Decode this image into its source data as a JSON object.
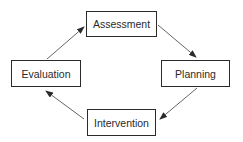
{
  "diagram": {
    "type": "cycle",
    "nodes": [
      {
        "id": "assessment",
        "label": "Assessment"
      },
      {
        "id": "planning",
        "label": "Planning"
      },
      {
        "id": "intervention",
        "label": "Intervention"
      },
      {
        "id": "evaluation",
        "label": "Evaluation"
      }
    ],
    "edges": [
      {
        "from": "assessment",
        "to": "planning"
      },
      {
        "from": "planning",
        "to": "intervention"
      },
      {
        "from": "intervention",
        "to": "evaluation"
      },
      {
        "from": "evaluation",
        "to": "assessment"
      }
    ],
    "colors": {
      "stroke": "#2a2a2a",
      "background": "#ffffff"
    }
  }
}
